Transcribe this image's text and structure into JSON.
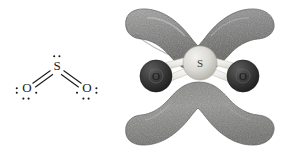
{
  "figure": {
    "background_color": "#ffffff",
    "width": 282,
    "height": 154
  },
  "lewis_structure": {
    "name": "sulfur-dioxide-lewis-structure",
    "molecule": "SO2",
    "center_atom": {
      "symbol": "S",
      "lone_pairs": 1,
      "lone_pair_dots": 2,
      "dot_positions": [
        "top"
      ]
    },
    "terminal_atoms": [
      {
        "symbol": "O",
        "side": "left",
        "lone_pairs": 2,
        "lone_pair_dots": 4,
        "dot_positions": [
          "left",
          "bottom-left",
          "bottom-right",
          "right"
        ],
        "bond_to_center": "double"
      },
      {
        "symbol": "O",
        "side": "right",
        "lone_pairs": 2,
        "lone_pair_dots": 4,
        "dot_positions": [
          "left",
          "bottom-left",
          "bottom-right",
          "right"
        ],
        "bond_to_center": "double"
      }
    ],
    "bonds": [
      {
        "from": "S",
        "to": "O-left",
        "order": 2,
        "style": "double-line"
      },
      {
        "from": "S",
        "to": "O-right",
        "order": 2,
        "style": "double-line"
      }
    ],
    "geometry": "bent"
  },
  "orbital_model": {
    "name": "sulfur-dioxide-pi-orbital-model",
    "molecule": "SO2",
    "atoms": [
      {
        "symbol": "S",
        "role": "center",
        "letter": "S",
        "sphere_color": "#d8d6d2",
        "position": "center"
      },
      {
        "symbol": "O",
        "role": "terminal",
        "letter": "O",
        "sphere_color": "#3a3a3a",
        "position": "left"
      },
      {
        "symbol": "O",
        "role": "terminal",
        "letter": "O",
        "sphere_color": "#3a3a3a",
        "position": "right"
      }
    ],
    "bond_sticks": {
      "count": 4,
      "color": "#f2f0ec",
      "description": "pale cylindrical bonds from S to each O"
    },
    "orbital_lobes": [
      {
        "name": "upper-pi-lobe",
        "fill": "#8d8d8d",
        "position": "above molecular plane",
        "shape": "wing"
      },
      {
        "name": "lower-pi-lobe",
        "fill": "#8d8d8d",
        "position": "below molecular plane",
        "shape": "wing"
      }
    ],
    "colors": {
      "lobe_light": "#b6b6b4",
      "lobe_mid": "#8d8d8c",
      "lobe_dark": "#6a6a69",
      "lobe_edge": "#5a5a59",
      "sulfur_sphere": "#d8d6d2",
      "oxygen_sphere": "#3a3a3a",
      "bond_stick": "#f2f0ec",
      "background": "#ffffff"
    }
  }
}
